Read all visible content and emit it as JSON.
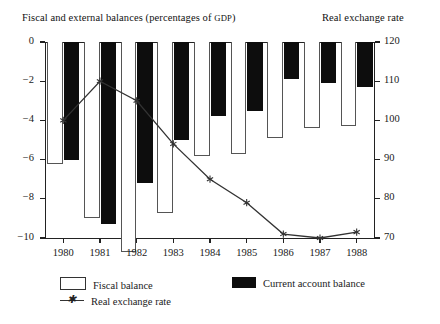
{
  "header": {
    "title_left_main": "Fiscal and external balances (percentages of ",
    "title_left_caps": "GDP",
    "title_left_tail": ")",
    "title_right": "Real exchange rate"
  },
  "legend": {
    "fiscal_label": "Fiscal balance",
    "current_label": "Current account balance",
    "line_label": "Real exchange rate",
    "fiscal_color": "#ffffff",
    "current_color": "#0d0d0d",
    "line_color": "#333333"
  },
  "axes": {
    "left_ticks": [
      "0",
      "-2",
      "-4",
      "-6",
      "-8",
      "-10"
    ],
    "right_ticks": [
      "120",
      "110",
      "100",
      "90",
      "80",
      "70"
    ],
    "x_ticks": [
      "1980",
      "1981",
      "1982",
      "1983",
      "1984",
      "1985",
      "1986",
      "1987",
      "1988"
    ]
  },
  "chart_data": {
    "type": "bar",
    "title": "Fiscal and external balances (percentages of GDP)",
    "subtitle": "Real exchange rate",
    "xlabel": "",
    "ylabel": "Fiscal and external balances (percentages of GDP)",
    "y2label": "Real exchange rate",
    "categories": [
      "1980",
      "1981",
      "1982",
      "1983",
      "1984",
      "1985",
      "1986",
      "1987",
      "1988"
    ],
    "ylim": [
      -10,
      0
    ],
    "y2lim": [
      70,
      120
    ],
    "grid": false,
    "legend_position": "bottom-left",
    "series": [
      {
        "name": "Fiscal balance",
        "type": "bar",
        "axis": "left",
        "color": "#ffffff",
        "values": [
          -6.2,
          -9.0,
          -10.4,
          -8.7,
          -5.8,
          -5.7,
          -4.9,
          -4.4,
          -4.3
        ]
      },
      {
        "name": "Current account balance",
        "type": "bar",
        "axis": "left",
        "color": "#0d0d0d",
        "values": [
          -6.0,
          -9.3,
          -7.2,
          -5.0,
          -3.8,
          -3.5,
          -1.9,
          -2.1,
          -2.3
        ]
      },
      {
        "name": "Real exchange rate",
        "type": "line",
        "axis": "right",
        "color": "#333333",
        "marker": "star",
        "values": [
          100,
          110,
          105,
          94,
          85,
          79,
          71,
          70,
          71.5
        ]
      }
    ]
  }
}
